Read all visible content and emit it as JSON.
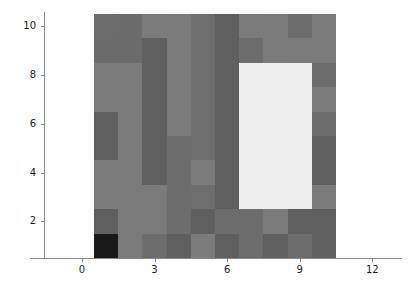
{
  "chart_data": {
    "type": "heatmap",
    "title": "",
    "xlabel": "",
    "ylabel": "",
    "colormap": "gray",
    "grid": false,
    "legend": null,
    "xlim": [
      0.5,
      10.5
    ],
    "ylim": [
      0.5,
      10.5
    ],
    "xticks": [
      0,
      3,
      6,
      9,
      12
    ],
    "yticks": [
      2,
      4,
      6,
      8,
      10
    ],
    "xtick_labels": [
      "0",
      "3",
      "6",
      "9",
      "12"
    ],
    "ytick_labels": [
      "2",
      "4",
      "6",
      "8",
      "10"
    ],
    "x_centers": [
      1,
      2,
      3,
      4,
      5,
      6,
      7,
      8,
      9,
      10
    ],
    "y_centers": [
      10,
      9,
      8,
      7,
      6,
      5,
      4,
      3,
      2,
      1
    ],
    "vmin": 0,
    "vmax": 255,
    "n_rows": 10,
    "n_cols": 10,
    "values": [
      [
        108,
        108,
        122,
        122,
        108,
        94,
        122,
        122,
        108,
        122
      ],
      [
        108,
        108,
        94,
        122,
        108,
        94,
        108,
        122,
        122,
        122
      ],
      [
        122,
        122,
        94,
        122,
        108,
        94,
        239,
        239,
        239,
        108
      ],
      [
        122,
        122,
        94,
        122,
        108,
        94,
        239,
        239,
        239,
        122
      ],
      [
        94,
        122,
        94,
        122,
        108,
        94,
        239,
        239,
        239,
        108
      ],
      [
        94,
        122,
        94,
        108,
        108,
        94,
        239,
        239,
        239,
        94
      ],
      [
        122,
        122,
        94,
        108,
        122,
        94,
        239,
        239,
        239,
        94
      ],
      [
        122,
        122,
        122,
        108,
        108,
        94,
        239,
        239,
        239,
        122
      ],
      [
        94,
        122,
        122,
        108,
        94,
        108,
        108,
        122,
        94,
        94
      ],
      [
        26,
        122,
        108,
        94,
        122,
        94,
        108,
        94,
        108,
        94
      ]
    ],
    "colors": [
      [
        "#6d6d6d",
        "#6c6c6c",
        "#7b7b7b",
        "#7a7a7a",
        "#6e6e6e",
        "#5f5f5f",
        "#7b7b7b",
        "#7a7a7a",
        "#6d6d6d",
        "#7b7b7b"
      ],
      [
        "#6c6c6c",
        "#6c6c6c",
        "#5f5f5f",
        "#7a7a7a",
        "#6e6e6e",
        "#5f5f5f",
        "#6d6d6d",
        "#7b7b7b",
        "#7a7a7a",
        "#7b7b7b"
      ],
      [
        "#7b7b7b",
        "#7a7a7a",
        "#5f5f5f",
        "#7a7a7a",
        "#6e6e6e",
        "#5f5f5f",
        "#eeeeee",
        "#eeeeee",
        "#eeeeee",
        "#6d6d6d"
      ],
      [
        "#7b7b7b",
        "#7a7a7a",
        "#5f5f5f",
        "#7a7a7a",
        "#6e6e6e",
        "#5f5f5f",
        "#eeeeee",
        "#eeeeee",
        "#eeeeee",
        "#7b7b7b"
      ],
      [
        "#5f5f5f",
        "#7a7a7a",
        "#5f5f5f",
        "#7a7a7a",
        "#6e6e6e",
        "#5f5f5f",
        "#eeeeee",
        "#eeeeee",
        "#eeeeee",
        "#6d6d6d"
      ],
      [
        "#5f5f5f",
        "#7a7a7a",
        "#5f5f5f",
        "#6d6d6d",
        "#6e6e6e",
        "#5f5f5f",
        "#eeeeee",
        "#eeeeee",
        "#eeeeee",
        "#5f5f5f"
      ],
      [
        "#7b7b7b",
        "#7a7a7a",
        "#5f5f5f",
        "#6d6d6d",
        "#7b7b7b",
        "#5f5f5f",
        "#eeeeee",
        "#eeeeee",
        "#eeeeee",
        "#5f5f5f"
      ],
      [
        "#7b7b7b",
        "#7a7a7a",
        "#7a7a7a",
        "#6d6d6d",
        "#6e6e6e",
        "#5f5f5f",
        "#eeeeee",
        "#eeeeee",
        "#eeeeee",
        "#7b7b7b"
      ],
      [
        "#5f5f5f",
        "#7a7a7a",
        "#7a7a7a",
        "#6d6d6d",
        "#5f5f5f",
        "#6d6d6d",
        "#6d6d6d",
        "#7b7b7b",
        "#5f5f5f",
        "#5f5f5f"
      ],
      [
        "#191919",
        "#7a7a7a",
        "#6d6d6d",
        "#5f5f5f",
        "#7b7b7b",
        "#5f5f5f",
        "#6d6d6d",
        "#5f5f5f",
        "#6d6d6d",
        "#5f5f5f"
      ]
    ]
  },
  "axes": {
    "spine_color": "#8a8a8a",
    "tick_color": "#8a8a8a",
    "label_color": "#1a1a1a"
  },
  "figure": {
    "background": "#ffffff"
  }
}
